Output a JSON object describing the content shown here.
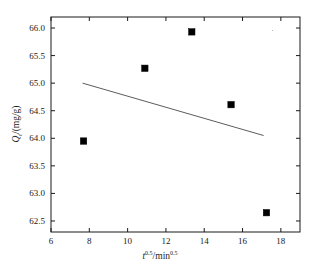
{
  "figure": {
    "background": "#ffffff",
    "frame_color": "#1a1a1a",
    "marker_color": "#000000",
    "trendline_color": "#4a4a4a"
  },
  "chart_data": {
    "type": "scatter",
    "title": "",
    "xlabel": "t^0.5/min^0.5",
    "ylabel": "Q_t/(mg/g)",
    "xlabel_parts": {
      "var": "t",
      "exp": "0.5",
      "sep": "/",
      "unit": "min",
      "unit_exp": "0.5"
    },
    "ylabel_parts": {
      "var": "Q",
      "sub": "t",
      "sep": "/",
      "unit": "(mg/g)"
    },
    "xlim": [
      6,
      19
    ],
    "ylim": [
      62.3,
      66.2
    ],
    "xticks": [
      6,
      8,
      10,
      12,
      14,
      16,
      18
    ],
    "xticklabels": [
      "6",
      "8",
      "10",
      "12",
      "14",
      "16",
      "18"
    ],
    "yticks": [
      62.5,
      63.0,
      63.5,
      64.0,
      64.5,
      65.0,
      65.5,
      66.0
    ],
    "yticklabels": [
      "62.5",
      "63.0",
      "63.5",
      "64.0",
      "64.5",
      "65.0",
      "65.5",
      "66.0"
    ],
    "grid": false,
    "legend": null,
    "series": [
      {
        "name": "Qt data",
        "marker": "filled-square",
        "x": [
          7.7,
          10.9,
          13.35,
          15.4,
          17.25
        ],
        "y": [
          63.95,
          65.27,
          65.93,
          64.61,
          62.65
        ]
      }
    ],
    "trendline": {
      "name": "linear fit",
      "x": [
        7.65,
        17.1
      ],
      "y": [
        65.0,
        64.05
      ]
    }
  }
}
